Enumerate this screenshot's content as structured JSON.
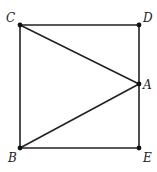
{
  "diagram": {
    "type": "geometry",
    "points": [
      {
        "id": "C",
        "label": "C",
        "x": 20,
        "y": 25,
        "lx": 6,
        "ly": 22
      },
      {
        "id": "D",
        "label": "D",
        "x": 139,
        "y": 25,
        "lx": 143,
        "ly": 22
      },
      {
        "id": "A",
        "label": "A",
        "x": 139,
        "y": 84,
        "lx": 143,
        "ly": 89
      },
      {
        "id": "B",
        "label": "B",
        "x": 20,
        "y": 148,
        "lx": 8,
        "ly": 162
      },
      {
        "id": "E",
        "label": "E",
        "x": 139,
        "y": 148,
        "lx": 143,
        "ly": 162
      }
    ],
    "segments": [
      {
        "from": "C",
        "to": "D"
      },
      {
        "from": "D",
        "to": "E"
      },
      {
        "from": "E",
        "to": "B"
      },
      {
        "from": "B",
        "to": "C"
      },
      {
        "from": "C",
        "to": "A"
      },
      {
        "from": "B",
        "to": "A"
      }
    ],
    "labels": {
      "C": "C",
      "D": "D",
      "A": "A",
      "B": "B",
      "E": "E"
    }
  }
}
